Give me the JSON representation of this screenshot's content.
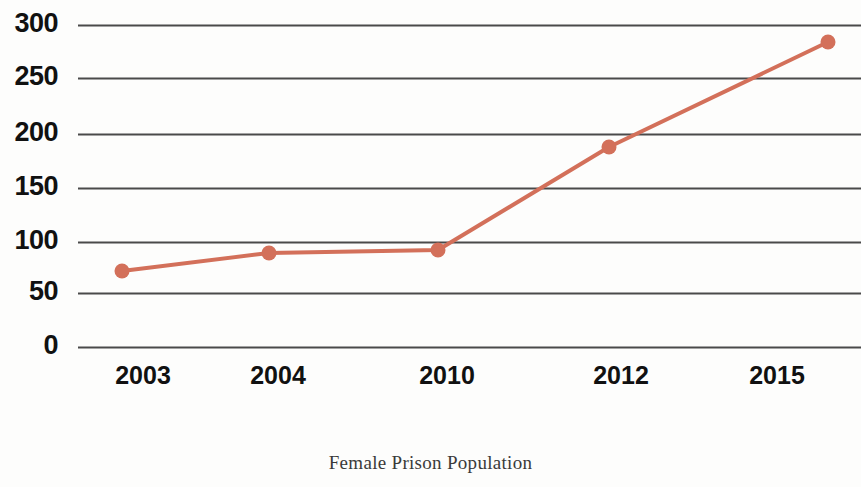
{
  "caption": "Female Prison Population",
  "colors": {
    "series_line": "#d3705a",
    "marker": "#d3705a",
    "gridline": "#4a4a4a",
    "text": "#111111",
    "caption_text": "#3a3a3a",
    "background": "#fdfdfc"
  },
  "axis": {
    "y_ticks": [
      "0",
      "50",
      "100",
      "150",
      "200",
      "250",
      "300"
    ],
    "x_ticks": [
      "2003",
      "2004",
      "2010",
      "2012",
      "2015"
    ]
  },
  "chart_data": {
    "type": "line",
    "title": "",
    "subtitle": "",
    "caption": "Female Prison Population",
    "xlabel": "",
    "ylabel": "",
    "categories": [
      "2003",
      "2004",
      "2010",
      "2012",
      "2015"
    ],
    "series": [
      {
        "name": "Female Prison Population",
        "values": [
          68,
          85,
          89,
          186,
          284
        ],
        "color": "#d3705a",
        "marker": "circle",
        "line_width": 4
      }
    ],
    "ylim": [
      0,
      300
    ],
    "yticks": [
      0,
      50,
      100,
      150,
      200,
      250,
      300
    ],
    "grid": true,
    "grid_axis": "y",
    "legend": false,
    "legend_position": "none",
    "point_pixels": [
      {
        "x": 122,
        "y": 271
      },
      {
        "x": 269,
        "y": 253
      },
      {
        "x": 438,
        "y": 250
      },
      {
        "x": 609,
        "y": 147
      },
      {
        "x": 828,
        "y": 42
      }
    ],
    "gridline_pixels": {
      "0": 347,
      "50": 293,
      "100": 242,
      "150": 188,
      "200": 134,
      "250": 78,
      "300": 25
    },
    "xtick_pixels": [
      143,
      278,
      447,
      621,
      777
    ]
  }
}
